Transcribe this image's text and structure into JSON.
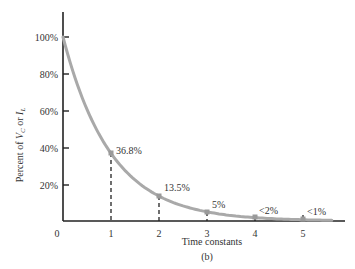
{
  "chart_data": {
    "type": "line",
    "title": "",
    "caption": "(b)",
    "xlabel": "Time constants",
    "ylabel": "Percent of V_C or I_L",
    "ylabel_parts": {
      "prefix": "Percent of ",
      "v": "V",
      "v_sub": "C",
      "mid": " or ",
      "i": "I",
      "i_sub": "L"
    },
    "x_ticks": [
      "0",
      "1",
      "2",
      "3",
      "4",
      "5"
    ],
    "y_ticks": [
      "20%",
      "40%",
      "60%",
      "80%",
      "100%"
    ],
    "xlim": [
      0,
      5.8
    ],
    "ylim": [
      0,
      115
    ],
    "grid": false,
    "series": [
      {
        "name": "Exponential decay",
        "color": "#a9a9a9",
        "x": [
          0,
          1,
          2,
          3,
          4,
          5
        ],
        "values": [
          100,
          36.8,
          13.5,
          5,
          1.8,
          0.7
        ]
      }
    ],
    "annotations": [
      {
        "x": 1,
        "y": 36.8,
        "label": "36.8%"
      },
      {
        "x": 2,
        "y": 13.5,
        "label": "13.5%"
      },
      {
        "x": 3,
        "y": 5,
        "label": "5%"
      },
      {
        "x": 4,
        "y": 1.8,
        "label": "<2%"
      },
      {
        "x": 5,
        "y": 0.7,
        "label": "<1%"
      }
    ]
  }
}
